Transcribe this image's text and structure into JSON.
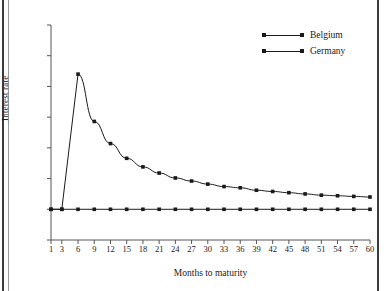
{
  "chart_data": {
    "type": "line",
    "title": "",
    "xlabel": "Months to maturity",
    "ylabel": "Interest rate",
    "x": [
      1,
      3,
      6,
      9,
      12,
      15,
      18,
      21,
      24,
      27,
      30,
      33,
      36,
      39,
      42,
      45,
      48,
      51,
      54,
      57,
      60
    ],
    "xtick_labels": [
      "1",
      "3",
      "6",
      "9",
      "12",
      "15",
      "18",
      "21",
      "24",
      "27",
      "30",
      "33",
      "36",
      "39",
      "42",
      "45",
      "48",
      "51",
      "54",
      "57",
      "60"
    ],
    "ytick_labels": [
      "0",
      "0.05",
      "0.10",
      "0.15",
      "0.20",
      "0.25",
      "0.30",
      "0.35"
    ],
    "ytick_values": [
      0,
      0.05,
      0.1,
      0.15,
      0.2,
      0.25,
      0.3,
      0.35
    ],
    "xlim": [
      1,
      60
    ],
    "ylim": [
      0,
      0.35
    ],
    "grid": false,
    "legend_position": "top-right",
    "series": [
      {
        "name": "Belgium",
        "color": "#1a1a1a",
        "marker": "square",
        "values": [
          0.05,
          0.05,
          0.27,
          0.193,
          0.157,
          0.133,
          0.119,
          0.109,
          0.101,
          0.096,
          0.091,
          0.087,
          0.085,
          0.081,
          0.079,
          0.077,
          0.075,
          0.073,
          0.072,
          0.071,
          0.07
        ]
      },
      {
        "name": "Germany",
        "color": "#1a1a1a",
        "marker": "square",
        "values": [
          0.05,
          0.05,
          0.05,
          0.05,
          0.05,
          0.05,
          0.05,
          0.05,
          0.05,
          0.05,
          0.05,
          0.05,
          0.05,
          0.05,
          0.05,
          0.05,
          0.05,
          0.05,
          0.05,
          0.05,
          0.05
        ]
      }
    ]
  },
  "legend": {
    "items": [
      {
        "label": "Belgium"
      },
      {
        "label": "Germany"
      }
    ]
  },
  "axes": {
    "x_axis_label": "Months to maturity",
    "y_axis_label": "Interest rate"
  }
}
